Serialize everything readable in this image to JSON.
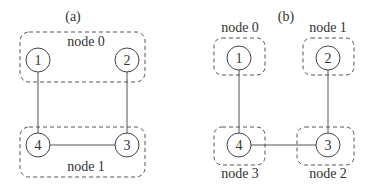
{
  "panels": [
    {
      "id": "a",
      "label": "(a)",
      "groups": [
        {
          "name": "node 0",
          "members": [
            "1",
            "2"
          ]
        },
        {
          "name": "node 1",
          "members": [
            "4",
            "3"
          ]
        }
      ],
      "vertices": [
        "1",
        "2",
        "3",
        "4"
      ],
      "edges": [
        [
          "1",
          "4"
        ],
        [
          "2",
          "3"
        ],
        [
          "4",
          "3"
        ]
      ]
    },
    {
      "id": "b",
      "label": "(b)",
      "groups": [
        {
          "name": "node 0",
          "members": [
            "1"
          ]
        },
        {
          "name": "node 1",
          "members": [
            "2"
          ]
        },
        {
          "name": "node 2",
          "members": [
            "3"
          ]
        },
        {
          "name": "node 3",
          "members": [
            "4"
          ]
        }
      ],
      "vertices": [
        "1",
        "2",
        "3",
        "4"
      ],
      "edges": [
        [
          "1",
          "4"
        ],
        [
          "2",
          "3"
        ],
        [
          "4",
          "3"
        ]
      ]
    }
  ],
  "colors": {
    "stroke": "#444444",
    "text": "#333333",
    "background": "#ffffff"
  }
}
